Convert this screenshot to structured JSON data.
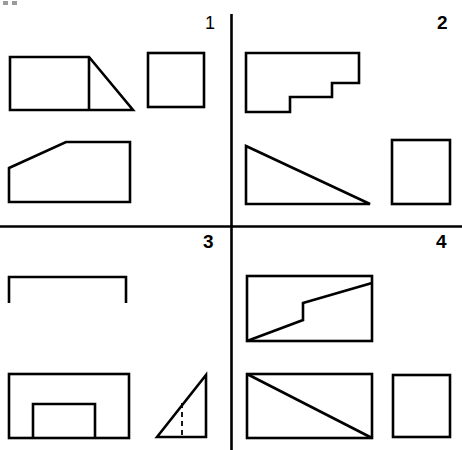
{
  "figure": {
    "title": "",
    "background_color": "#ffffff",
    "stroke_color": "#000000",
    "canvas": {
      "width": 462,
      "height": 450
    },
    "axes": {
      "vertical_divider_label": "vertical-divider",
      "horizontal_divider_label": "horizontal-divider",
      "vertical_x": 231,
      "horizontal_y": 226
    },
    "quadrant_labels": [
      {
        "id": "1",
        "text": "1",
        "quadrant": "top-left"
      },
      {
        "id": "2",
        "text": "2",
        "quadrant": "top-right"
      },
      {
        "id": "3",
        "text": "3",
        "quadrant": "bottom-left"
      },
      {
        "id": "4",
        "text": "4",
        "quadrant": "bottom-right"
      }
    ],
    "shapes": [
      {
        "name": "rectangle-with-right-triangle",
        "quadrant": "1",
        "description": "rectangle with attached right triangle",
        "points": "10,57 133,57 133,110 10,110",
        "extra": "88,57 88,110"
      },
      {
        "name": "square-top-left-quadrant",
        "quadrant": "1",
        "description": "square"
      },
      {
        "name": "trapezoid",
        "quadrant": "1",
        "description": "trapezoid with slanted left-top edge"
      },
      {
        "name": "stepped-polygon",
        "quadrant": "2",
        "description": "stepped L-shaped polygon"
      },
      {
        "name": "right-triangle-large",
        "quadrant": "2",
        "description": "right triangle pointing right"
      },
      {
        "name": "square-top-right-quadrant",
        "quadrant": "2",
        "description": "square"
      },
      {
        "name": "open-bracket",
        "quadrant": "3",
        "description": "open-bottom bracket shape"
      },
      {
        "name": "rectangle-with-notch",
        "quadrant": "3",
        "description": "rectangle with bottom notch"
      },
      {
        "name": "right-triangle-dashed",
        "quadrant": "3",
        "description": "right triangle with dashed altitude"
      },
      {
        "name": "rectangle-stepped-diagonal",
        "quadrant": "4",
        "description": "rectangle with stepped diagonal"
      },
      {
        "name": "rectangle-with-diagonal",
        "quadrant": "4",
        "description": "rectangle with full diagonal"
      },
      {
        "name": "square-bottom-right-quadrant",
        "quadrant": "4",
        "description": "square"
      }
    ]
  }
}
